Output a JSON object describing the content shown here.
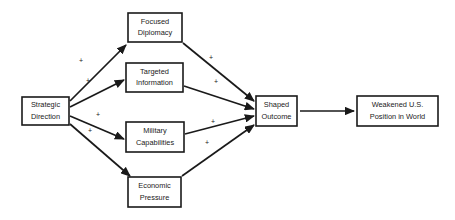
{
  "diagram": {
    "colors": {
      "background": "#ffffff",
      "stroke": "#1a1a1a",
      "box_fill": "#ffffff",
      "text": "#1a1a1a"
    },
    "nodes": [
      {
        "id": "strategic-direction",
        "line1": "Strategic",
        "line2": "Direction",
        "x": 22,
        "y": 97,
        "w": 47,
        "h": 28
      },
      {
        "id": "focused-diplomacy",
        "line1": "Focused",
        "line2": "Diplomacy",
        "x": 128,
        "y": 13,
        "w": 54,
        "h": 29
      },
      {
        "id": "targeted-information",
        "line1": "Targeted",
        "line2": "Information",
        "x": 126,
        "y": 63,
        "w": 57,
        "h": 29
      },
      {
        "id": "military-capabilities",
        "line1": "Military",
        "line2": "Capabilities",
        "x": 126,
        "y": 122,
        "w": 58,
        "h": 30
      },
      {
        "id": "economic-pressure",
        "line1": "Economic",
        "line2": "Pressure",
        "x": 128,
        "y": 177,
        "w": 53,
        "h": 30
      },
      {
        "id": "shaped-outcome",
        "line1": "Shaped",
        "line2": "Outcome",
        "x": 256,
        "y": 96,
        "w": 41,
        "h": 30
      },
      {
        "id": "weakened-us-position",
        "line1": "Weakened U.S.",
        "line2": "Position in World",
        "x": 357,
        "y": 96,
        "w": 81,
        "h": 30
      }
    ],
    "edges": [
      {
        "id": "strategic-to-focused",
        "from": "strategic-direction",
        "to": "focused-diplomacy",
        "x1": 70,
        "y1": 101,
        "x2": 126,
        "y2": 45,
        "sign": "+",
        "sign_x": 81,
        "sign_y": 61
      },
      {
        "id": "strategic-to-targeted",
        "from": "strategic-direction",
        "to": "targeted-information",
        "x1": 70,
        "y1": 107,
        "x2": 124,
        "y2": 80,
        "sign": "+",
        "sign_x": 88,
        "sign_y": 81
      },
      {
        "id": "strategic-to-military",
        "from": "strategic-direction",
        "to": "military-capabilities",
        "x1": 70,
        "y1": 116,
        "x2": 124,
        "y2": 139,
        "sign": "+",
        "sign_x": 98,
        "sign_y": 115
      },
      {
        "id": "strategic-to-economic",
        "from": "strategic-direction",
        "to": "economic-pressure",
        "x1": 70,
        "y1": 124,
        "x2": 130,
        "y2": 176,
        "sign": "+",
        "sign_x": 90,
        "sign_y": 131
      },
      {
        "id": "focused-to-shaped",
        "from": "focused-diplomacy",
        "to": "shaped-outcome",
        "x1": 183,
        "y1": 43,
        "x2": 254,
        "y2": 101,
        "sign": "+",
        "sign_x": 211,
        "sign_y": 58
      },
      {
        "id": "targeted-to-shaped",
        "from": "targeted-information",
        "to": "shaped-outcome",
        "x1": 184,
        "y1": 86,
        "x2": 254,
        "y2": 109,
        "sign": "+",
        "sign_x": 216,
        "sign_y": 82
      },
      {
        "id": "military-to-shaped",
        "from": "military-capabilities",
        "to": "shaped-outcome",
        "x1": 185,
        "y1": 134,
        "x2": 254,
        "y2": 116,
        "sign": "+",
        "sign_x": 213,
        "sign_y": 122
      },
      {
        "id": "economic-to-shaped",
        "from": "economic-pressure",
        "to": "shaped-outcome",
        "x1": 182,
        "y1": 176,
        "x2": 254,
        "y2": 125,
        "sign": "+",
        "sign_x": 207,
        "sign_y": 143
      },
      {
        "id": "shaped-to-weakened",
        "from": "shaped-outcome",
        "to": "weakened-us-position",
        "x1": 300,
        "y1": 111,
        "x2": 354,
        "y2": 111,
        "sign": "",
        "sign_x": 0,
        "sign_y": 0
      }
    ]
  }
}
